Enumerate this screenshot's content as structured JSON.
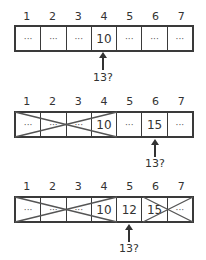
{
  "indices": [
    "1",
    "2",
    "3",
    "4",
    "5",
    "6",
    "7"
  ],
  "panels": [
    {
      "cells": [
        "···",
        "···",
        "···",
        "10",
        "···",
        "···",
        "···"
      ],
      "query": "13?",
      "arrow_at_index": 4,
      "crossed_ranges": []
    },
    {
      "cells": [
        "···",
        "···",
        "···",
        "10",
        "···",
        "15",
        "···"
      ],
      "query": "13?",
      "arrow_at_index": 6,
      "crossed_ranges": [
        [
          1,
          4
        ]
      ]
    },
    {
      "cells": [
        "···",
        "···",
        "···",
        "10",
        "12",
        "15",
        "···"
      ],
      "query": "13?",
      "arrow_at_index": 5,
      "crossed_ranges": [
        [
          1,
          4
        ],
        [
          6,
          7
        ]
      ]
    }
  ],
  "colors": {
    "line": "#3a3a3a",
    "cross": "#555555",
    "text": "#333333"
  }
}
